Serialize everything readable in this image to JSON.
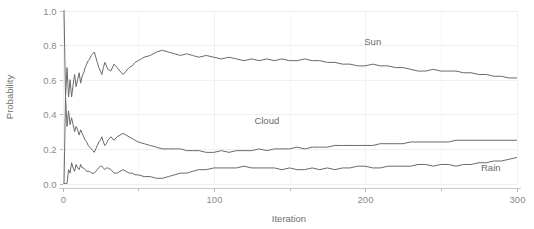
{
  "chart_data": {
    "type": "line",
    "title": "",
    "xlabel": "Iteration",
    "ylabel": "Probability",
    "xlim": [
      0,
      300
    ],
    "ylim": [
      0.0,
      1.0
    ],
    "grid": true,
    "legend_position": "inline-annotations",
    "x_ticks": [
      0,
      100,
      200,
      300
    ],
    "x_tick_labels": [
      "0",
      "100",
      "200",
      "300"
    ],
    "x_minor_ticks": [
      50,
      150,
      250
    ],
    "y_ticks": [
      0.0,
      0.2,
      0.4,
      0.6,
      0.8,
      1.0
    ],
    "y_tick_labels": [
      "0.0",
      "0.2",
      "0.4",
      "0.6",
      "0.8",
      "1.0"
    ],
    "line_color": "#6a6a6a",
    "annotations": [
      {
        "text": "Sun",
        "x": 205,
        "y": 0.8
      },
      {
        "text": "Cloud",
        "x": 135,
        "y": 0.345
      },
      {
        "text": "Rain",
        "x": 283,
        "y": 0.075
      }
    ],
    "x": [
      1,
      2,
      3,
      4,
      5,
      6,
      7,
      8,
      9,
      10,
      11,
      12,
      13,
      14,
      15,
      16,
      17,
      18,
      19,
      20,
      21,
      22,
      23,
      24,
      25,
      26,
      27,
      28,
      29,
      30,
      32,
      34,
      36,
      38,
      40,
      42,
      44,
      46,
      48,
      50,
      54,
      58,
      62,
      66,
      70,
      74,
      78,
      82,
      86,
      90,
      95,
      100,
      105,
      110,
      115,
      120,
      125,
      130,
      135,
      140,
      145,
      150,
      155,
      160,
      165,
      170,
      175,
      180,
      185,
      190,
      195,
      200,
      205,
      210,
      215,
      220,
      225,
      230,
      235,
      240,
      245,
      250,
      255,
      260,
      265,
      270,
      275,
      280,
      285,
      290,
      295,
      300
    ],
    "series": [
      {
        "name": "Sun",
        "values": [
          1.0,
          0.5,
          0.67,
          0.5,
          0.6,
          0.5,
          0.57,
          0.63,
          0.56,
          0.6,
          0.64,
          0.58,
          0.62,
          0.64,
          0.67,
          0.69,
          0.71,
          0.72,
          0.74,
          0.75,
          0.76,
          0.73,
          0.7,
          0.67,
          0.65,
          0.63,
          0.67,
          0.7,
          0.68,
          0.66,
          0.65,
          0.69,
          0.67,
          0.65,
          0.63,
          0.65,
          0.67,
          0.68,
          0.7,
          0.71,
          0.73,
          0.74,
          0.76,
          0.77,
          0.76,
          0.75,
          0.74,
          0.75,
          0.74,
          0.73,
          0.74,
          0.73,
          0.72,
          0.73,
          0.72,
          0.71,
          0.72,
          0.71,
          0.72,
          0.71,
          0.72,
          0.71,
          0.71,
          0.72,
          0.71,
          0.71,
          0.7,
          0.7,
          0.69,
          0.69,
          0.68,
          0.68,
          0.69,
          0.68,
          0.68,
          0.67,
          0.67,
          0.66,
          0.65,
          0.65,
          0.66,
          0.65,
          0.65,
          0.65,
          0.64,
          0.64,
          0.63,
          0.63,
          0.62,
          0.62,
          0.61,
          0.61
        ]
      },
      {
        "name": "Cloud",
        "values": [
          0.0,
          0.5,
          0.33,
          0.42,
          0.34,
          0.38,
          0.34,
          0.3,
          0.33,
          0.31,
          0.28,
          0.31,
          0.29,
          0.27,
          0.25,
          0.24,
          0.22,
          0.21,
          0.2,
          0.19,
          0.18,
          0.2,
          0.22,
          0.24,
          0.25,
          0.27,
          0.24,
          0.22,
          0.23,
          0.25,
          0.27,
          0.25,
          0.27,
          0.28,
          0.29,
          0.28,
          0.27,
          0.26,
          0.25,
          0.24,
          0.23,
          0.22,
          0.21,
          0.2,
          0.2,
          0.2,
          0.2,
          0.19,
          0.19,
          0.19,
          0.18,
          0.18,
          0.19,
          0.18,
          0.19,
          0.19,
          0.19,
          0.2,
          0.19,
          0.2,
          0.2,
          0.2,
          0.21,
          0.2,
          0.21,
          0.21,
          0.21,
          0.22,
          0.22,
          0.22,
          0.22,
          0.22,
          0.22,
          0.23,
          0.23,
          0.23,
          0.23,
          0.24,
          0.24,
          0.24,
          0.24,
          0.24,
          0.24,
          0.25,
          0.25,
          0.25,
          0.25,
          0.25,
          0.25,
          0.25,
          0.25,
          0.25
        ]
      },
      {
        "name": "Rain",
        "values": [
          0.0,
          0.0,
          0.0,
          0.08,
          0.06,
          0.12,
          0.09,
          0.07,
          0.11,
          0.09,
          0.08,
          0.11,
          0.09,
          0.09,
          0.08,
          0.07,
          0.07,
          0.07,
          0.06,
          0.06,
          0.06,
          0.07,
          0.08,
          0.09,
          0.1,
          0.1,
          0.09,
          0.08,
          0.09,
          0.09,
          0.08,
          0.06,
          0.06,
          0.07,
          0.08,
          0.07,
          0.06,
          0.06,
          0.05,
          0.05,
          0.04,
          0.04,
          0.03,
          0.03,
          0.04,
          0.05,
          0.06,
          0.06,
          0.07,
          0.08,
          0.08,
          0.09,
          0.09,
          0.09,
          0.09,
          0.1,
          0.09,
          0.09,
          0.09,
          0.09,
          0.08,
          0.09,
          0.08,
          0.08,
          0.09,
          0.08,
          0.09,
          0.08,
          0.09,
          0.09,
          0.1,
          0.1,
          0.09,
          0.09,
          0.1,
          0.1,
          0.1,
          0.1,
          0.11,
          0.11,
          0.1,
          0.11,
          0.11,
          0.1,
          0.11,
          0.11,
          0.12,
          0.12,
          0.13,
          0.13,
          0.14,
          0.15
        ]
      }
    ]
  }
}
